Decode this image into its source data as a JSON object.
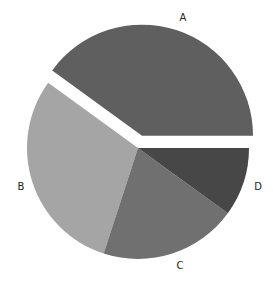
{
  "chart_data": {
    "type": "pie",
    "title": "",
    "categories": [
      "A",
      "B",
      "C",
      "D"
    ],
    "values": [
      40,
      30,
      20,
      10
    ],
    "explode": [
      0.12,
      0,
      0,
      0
    ],
    "start_angle_deg": 0,
    "direction": "counterclockwise",
    "colors": [
      "#5f5f5f",
      "#a5a5a5",
      "#707070",
      "#474747"
    ],
    "labels_position": "outside",
    "legend": "none",
    "grid": false
  },
  "geometry": {
    "cx": 138,
    "cy": 148,
    "r": 111,
    "explode_px": 13,
    "label_positions": [
      {
        "x": 183,
        "y": 21
      },
      {
        "x": 21,
        "y": 190
      },
      {
        "x": 180,
        "y": 269
      },
      {
        "x": 258,
        "y": 190
      }
    ]
  }
}
